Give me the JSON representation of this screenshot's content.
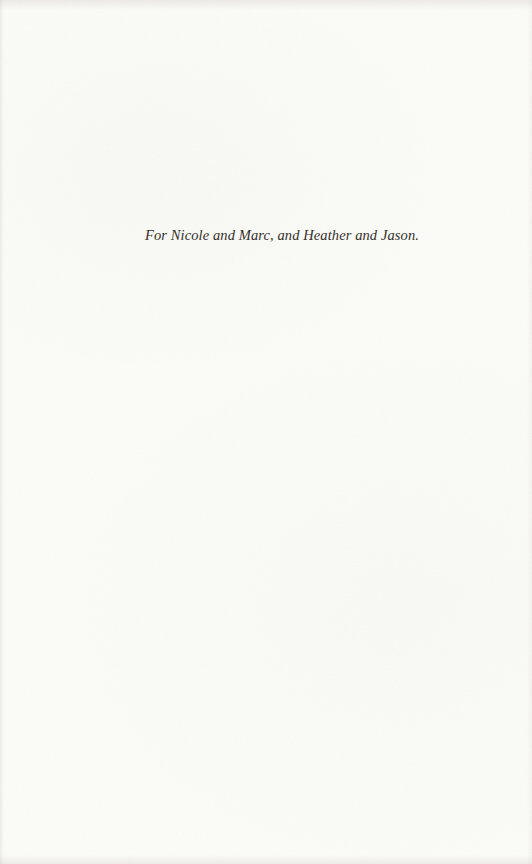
{
  "page": {
    "type": "book-dedication-page",
    "dedication": "For Nicole and Marc, and Heather and Jason."
  },
  "colors": {
    "paper": "#fcfcf9",
    "ink": "#35302b"
  }
}
